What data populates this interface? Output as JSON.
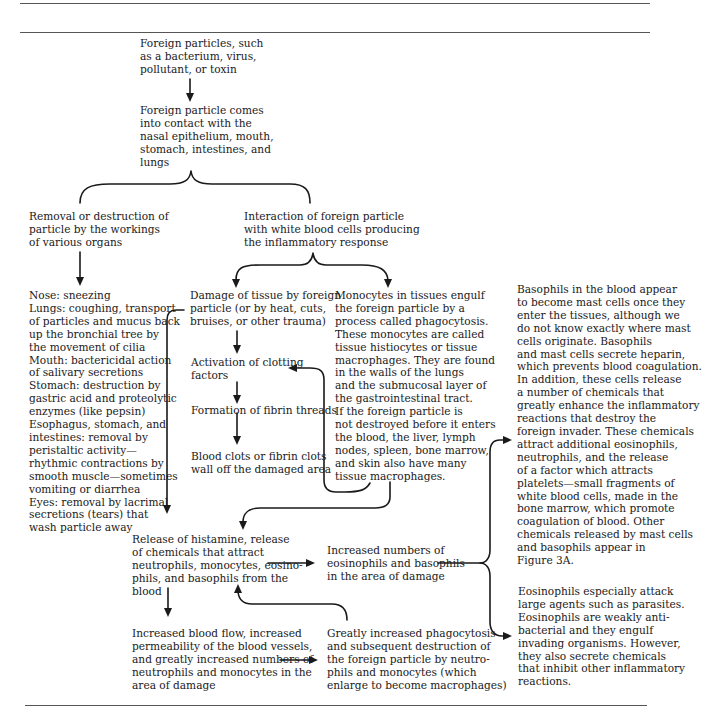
{
  "figure": {
    "type": "flowchart",
    "title": "",
    "nodes": {
      "foreign_particles": {
        "lines": [
          "Foreign particles, such",
          "as a bacterium, virus,",
          "pollutant, or toxin"
        ]
      },
      "contact": {
        "lines": [
          "Foreign particle comes",
          "into contact with the",
          "nasal epithelium, mouth,",
          "stomach, intestines, and",
          "lungs"
        ]
      },
      "removal": {
        "lines": [
          "Removal or destruction of",
          "particle by the workings",
          "of various organs"
        ]
      },
      "interaction": {
        "lines": [
          "Interaction of foreign particle",
          "with white blood cells producing",
          "the inflammatory response"
        ]
      },
      "organs": {
        "lines": [
          "Nose: sneezing",
          "Lungs: coughing, transport",
          "of particles and mucus back",
          "up the bronchial tree by",
          "the movement of cilia",
          "Mouth: bactericidal action",
          "of salivary secretions",
          "Stomach: destruction by",
          "gastric acid and proteolytic",
          "enzymes (like pepsin)",
          "Esophagus, stomach, and",
          "intestines: removal by",
          "peristaltic activity—",
          "rhythmic contractions by",
          "smooth muscle—sometimes",
          "vomiting or diarrhea",
          "Eyes: removal by lacrimal",
          "secretions (tears) that",
          "wash particle away"
        ]
      },
      "damage": {
        "lines": [
          "Damage of tissue by foreign",
          "particle (or by heat, cuts,",
          "bruises, or other trauma)"
        ]
      },
      "clotting": {
        "lines": [
          "Activation of clotting",
          "factors"
        ]
      },
      "fibrin": {
        "lines": [
          "Formation of fibrin threads"
        ]
      },
      "clots": {
        "lines": [
          "Blood clots or fibrin clots",
          "wall off the damaged area"
        ]
      },
      "monocytes": {
        "lines": [
          "Monocytes in tissues engulf",
          "the foreign particle by a",
          "process called phagocytosis.",
          "These monocytes are called",
          "tissue histiocytes or tissue",
          "macrophages. They are found",
          "in the walls of the lungs",
          "and the submucosal layer of",
          "the gastrointestinal tract.",
          "If the foreign particle is",
          "not destroyed before it enters",
          "the blood, the liver, lymph",
          "nodes, spleen, bone marrow,",
          "and skin also have many",
          "tissue macrophages."
        ]
      },
      "histamine": {
        "lines": [
          "Release of histamine, release",
          "of chemicals that attract",
          "neutrophils, monocytes, eosino-",
          "phils, and basophils from the",
          "blood"
        ]
      },
      "eos_baso": {
        "lines": [
          "Increased numbers of",
          "eosinophils and basophils",
          "in the area of damage"
        ]
      },
      "blood_flow": {
        "lines": [
          "Increased blood flow, increased",
          "permeability of the blood vessels,",
          "and greatly increased numbers of",
          "neutrophils and monocytes in the",
          "area of damage"
        ]
      },
      "phagocytosis": {
        "lines": [
          "Greatly increased phagocytosis",
          "and subsequent destruction of",
          "the foreign particle by neutro-",
          "phils and monocytes (which",
          "enlarge to become macrophages)"
        ]
      },
      "basophils": {
        "lines": [
          "Basophils in the blood appear",
          "to become mast cells once they",
          "enter the tissues, although we",
          "do not know exactly where mast",
          "cells originate. Basophils",
          "and mast cells secrete heparin,",
          "which prevents blood coagulation.",
          "In addition, these cells release",
          "a number of chemicals that",
          "greatly enhance the inflammatory",
          "reactions that destroy the",
          "foreign invader. These chemicals",
          "attract additional eosinophils,",
          "neutrophils, and the release",
          "of a factor which attracts",
          "platelets—small fragments of",
          "white blood cells, made in the",
          "bone marrow, which promote",
          "coagulation of blood. Other",
          "chemicals released by mast cells",
          "and basophils appear in",
          "Figure 3A."
        ]
      },
      "eosinophils": {
        "lines": [
          "Eosinophils especially attack",
          "large agents such as parasites.",
          "Eosinophils are weakly anti-",
          "bacterial and they engulf",
          "invading organisms. However,",
          "they also secrete chemicals",
          "that inhibit other inflammatory",
          "reactions."
        ]
      }
    },
    "edges": [
      {
        "from": "foreign_particles",
        "to": "contact",
        "type": "arrow"
      },
      {
        "from": "contact",
        "to": [
          "removal",
          "interaction"
        ],
        "type": "brace"
      },
      {
        "from": "removal",
        "to": "organs",
        "type": "arrow"
      },
      {
        "from": "interaction",
        "to": [
          "damage",
          "monocytes"
        ],
        "type": "brace-arrows"
      },
      {
        "from": "damage",
        "to": "clotting",
        "type": "arrow"
      },
      {
        "from": "clotting",
        "to": "fibrin",
        "type": "arrow"
      },
      {
        "from": "fibrin",
        "to": "clots",
        "type": "arrow"
      },
      {
        "from": "damage",
        "to": "histamine",
        "type": "arrow"
      },
      {
        "from": "monocytes",
        "to": "clotting",
        "type": "arrow"
      },
      {
        "from": "monocytes",
        "to": "histamine",
        "type": "arrow"
      },
      {
        "from": "histamine",
        "to": "eos_baso",
        "type": "arrow"
      },
      {
        "from": "histamine",
        "to": "blood_flow",
        "type": "arrow"
      },
      {
        "from": "blood_flow",
        "to": "phagocytosis",
        "type": "arrow"
      },
      {
        "from": "phagocytosis",
        "to": "histamine",
        "type": "arrow"
      },
      {
        "from": "eos_baso",
        "to": [
          "basophils",
          "eosinophils"
        ],
        "type": "brace-arrows"
      }
    ]
  }
}
